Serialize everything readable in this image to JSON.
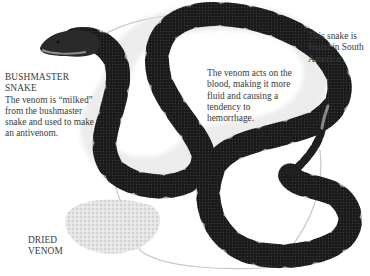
{
  "figure": {
    "subject": "bushmaster snake",
    "venom_label": "dried venom"
  },
  "captions": {
    "main": {
      "heading_line1": "BUSHMASTER",
      "heading_line2": "SNAKE",
      "body": "The venom is “milked” from the bushmaster snake and used to make an antivenom."
    },
    "blood": {
      "body": "The venom acts on the blood, making it more fluid and causing a tendency to hemorrhage."
    },
    "region": {
      "body": "This snake is found in South America."
    },
    "dried_venom": {
      "line1": "DRIED",
      "line2": "VENOM"
    }
  },
  "colors": {
    "background": "#ffffff",
    "text": "#3a3a3a",
    "snake_dark": "#1c1c1c",
    "snake_light": "#a8a8a8",
    "circle_line": "#c8c8c8",
    "venom": "#d4d4d4"
  }
}
